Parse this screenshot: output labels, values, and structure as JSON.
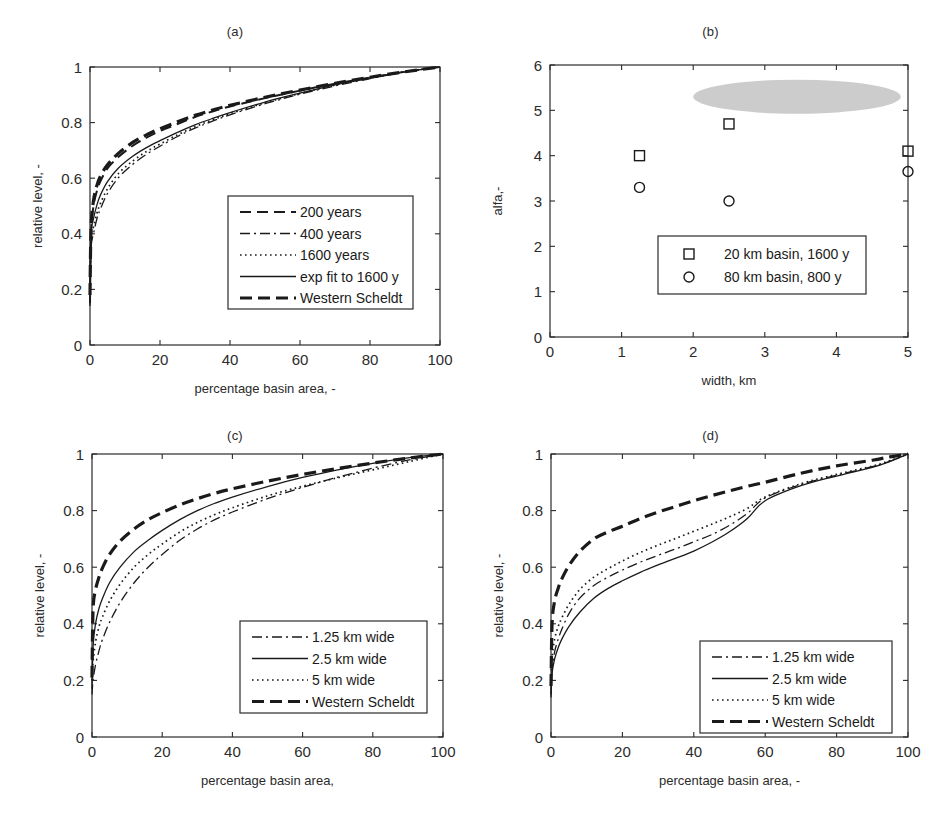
{
  "figure": {
    "background": "#ffffff",
    "axis_color": "#2b2b2b",
    "curve_color": "#1a1a1a",
    "ellipse_color": "#cccccc"
  },
  "panels": [
    {
      "id": "a",
      "title": "(a)",
      "xlabel": "percentage basin area, -",
      "ylabel": "relative level, -",
      "xticks": [
        "0",
        "20",
        "40",
        "60",
        "80",
        "100"
      ],
      "yticks": [
        "0",
        "0.2",
        "0.4",
        "0.6",
        "0.8",
        "1"
      ],
      "legend": [
        {
          "label": "200 years",
          "style": "dashed"
        },
        {
          "label": "400 years",
          "style": "dashdot"
        },
        {
          "label": "1600 years",
          "style": "dotted"
        },
        {
          "label": "exp fit to 1600 y",
          "style": "solid"
        },
        {
          "label": "Western Scheldt",
          "style": "thickdashed"
        }
      ]
    },
    {
      "id": "b",
      "title": "(b)",
      "xlabel": "width, km",
      "ylabel": "alfa,-",
      "xticks": [
        "0",
        "1",
        "2",
        "3",
        "4",
        "5"
      ],
      "yticks": [
        "0",
        "1",
        "2",
        "3",
        "4",
        "5",
        "6"
      ],
      "legend": [
        {
          "label": "20 km basin, 1600 y",
          "marker": "square"
        },
        {
          "label": "80 km basin, 800 y",
          "marker": "circle"
        }
      ]
    },
    {
      "id": "c",
      "title": "(c)",
      "xlabel": "percentage basin area,",
      "ylabel": "relative level, -",
      "xticks": [
        "0",
        "20",
        "40",
        "60",
        "80",
        "100"
      ],
      "yticks": [
        "0",
        "0.2",
        "0.4",
        "0.6",
        "0.8",
        "1"
      ],
      "legend": [
        {
          "label": "1.25 km wide",
          "style": "dashdot"
        },
        {
          "label": "2.5 km wide",
          "style": "solid"
        },
        {
          "label": "5 km wide",
          "style": "dotted"
        },
        {
          "label": "Western Scheldt",
          "style": "thickdashed"
        }
      ]
    },
    {
      "id": "d",
      "title": "(d)",
      "xlabel": "percentage basin area, -",
      "ylabel": "relative level, -",
      "xticks": [
        "0",
        "20",
        "40",
        "60",
        "80",
        "100"
      ],
      "yticks": [
        "0",
        "0.2",
        "0.4",
        "0.6",
        "0.8",
        "1"
      ],
      "legend": [
        {
          "label": "1.25 km wide",
          "style": "dashdot"
        },
        {
          "label": "2.5 km wide",
          "style": "solid"
        },
        {
          "label": "5 km wide",
          "style": "dotted"
        },
        {
          "label": "Western Scheldt",
          "style": "thickdashed"
        }
      ]
    }
  ],
  "chart_data": [
    {
      "type": "line",
      "panel": "a",
      "title": "(a)",
      "xlabel": "percentage basin area, -",
      "ylabel": "relative level, -",
      "xlim": [
        0,
        100
      ],
      "ylim": [
        0,
        1
      ],
      "xticks": [
        0,
        20,
        40,
        60,
        80,
        100
      ],
      "yticks": [
        0,
        0.2,
        0.4,
        0.6,
        0.8,
        1
      ],
      "grid": false,
      "legend_position": "lower right",
      "x": [
        0,
        0.3,
        1,
        2,
        3,
        5,
        8,
        12,
        16,
        20,
        25,
        30,
        35,
        40,
        50,
        60,
        70,
        80,
        90,
        100
      ],
      "series": [
        {
          "name": "200 years",
          "style": "dashed",
          "values": [
            0.15,
            0.4,
            0.5,
            0.555,
            0.59,
            0.635,
            0.675,
            0.715,
            0.745,
            0.77,
            0.795,
            0.82,
            0.84,
            0.858,
            0.888,
            0.915,
            0.94,
            0.962,
            0.983,
            1.0
          ]
        },
        {
          "name": "400 years",
          "style": "dashdot",
          "values": [
            0.14,
            0.345,
            0.4,
            0.455,
            0.49,
            0.545,
            0.6,
            0.648,
            0.685,
            0.715,
            0.75,
            0.78,
            0.805,
            0.828,
            0.868,
            0.902,
            0.932,
            0.958,
            0.982,
            1.0
          ]
        },
        {
          "name": "1600 years",
          "style": "dotted",
          "values": [
            0.17,
            0.38,
            0.425,
            0.475,
            0.51,
            0.562,
            0.615,
            0.66,
            0.695,
            0.723,
            0.756,
            0.785,
            0.81,
            0.832,
            0.871,
            0.905,
            0.935,
            0.96,
            0.983,
            1.0
          ]
        },
        {
          "name": "exp fit to 1600 y",
          "style": "solid",
          "values": [
            0.2,
            0.4,
            0.455,
            0.505,
            0.54,
            0.588,
            0.635,
            0.677,
            0.709,
            0.735,
            0.765,
            0.792,
            0.815,
            0.836,
            0.874,
            0.906,
            0.936,
            0.961,
            0.983,
            1.0
          ]
        },
        {
          "name": "Western Scheldt",
          "style": "thickdashed",
          "values": [
            0.18,
            0.42,
            0.52,
            0.575,
            0.608,
            0.648,
            0.688,
            0.727,
            0.755,
            0.778,
            0.803,
            0.826,
            0.845,
            0.862,
            0.891,
            0.917,
            0.941,
            0.963,
            0.983,
            1.0
          ]
        }
      ]
    },
    {
      "type": "scatter",
      "panel": "b",
      "title": "(b)",
      "xlabel": "width, km",
      "ylabel": "alfa,-",
      "xlim": [
        0,
        5
      ],
      "ylim": [
        0,
        6
      ],
      "xticks": [
        0,
        1,
        2,
        3,
        4,
        5
      ],
      "yticks": [
        0,
        1,
        2,
        3,
        4,
        5,
        6
      ],
      "grid": false,
      "legend_position": "lower right",
      "series": [
        {
          "name": "20 km basin, 1600 y",
          "marker": "square",
          "points": [
            [
              1.25,
              4.0
            ],
            [
              2.5,
              4.7
            ],
            [
              5.0,
              4.1
            ]
          ]
        },
        {
          "name": "80 km basin, 800 y",
          "marker": "circle",
          "points": [
            [
              1.25,
              3.3
            ],
            [
              2.5,
              3.0
            ],
            [
              5.0,
              3.65
            ]
          ]
        }
      ],
      "annotations": [
        {
          "type": "ellipse",
          "label": "gray shaded region",
          "center": [
            3.45,
            5.3
          ],
          "width": 2.9,
          "height": 0.75,
          "color": "#cccccc"
        }
      ]
    },
    {
      "type": "line",
      "panel": "c",
      "title": "(c)",
      "xlabel": "percentage basin area,",
      "ylabel": "relative level, -",
      "xlim": [
        0,
        100
      ],
      "ylim": [
        0,
        1
      ],
      "xticks": [
        0,
        20,
        40,
        60,
        80,
        100
      ],
      "yticks": [
        0,
        0.2,
        0.4,
        0.6,
        0.8,
        1
      ],
      "grid": false,
      "legend_position": "lower right",
      "x": [
        0,
        0.3,
        1,
        2,
        3,
        5,
        8,
        12,
        16,
        20,
        25,
        30,
        35,
        40,
        50,
        60,
        70,
        80,
        90,
        100
      ],
      "series": [
        {
          "name": "1.25 km wide",
          "style": "dashdot",
          "values": [
            0.15,
            0.2,
            0.255,
            0.305,
            0.345,
            0.405,
            0.475,
            0.545,
            0.6,
            0.645,
            0.695,
            0.735,
            0.768,
            0.795,
            0.842,
            0.882,
            0.918,
            0.95,
            0.978,
            1.0
          ]
        },
        {
          "name": "2.5 km wide",
          "style": "solid",
          "values": [
            0.17,
            0.32,
            0.4,
            0.455,
            0.49,
            0.545,
            0.6,
            0.655,
            0.695,
            0.73,
            0.768,
            0.8,
            0.826,
            0.848,
            0.885,
            0.917,
            0.944,
            0.967,
            0.986,
            1.0
          ]
        },
        {
          "name": "5 km wide",
          "style": "dotted",
          "values": [
            0.2,
            0.265,
            0.335,
            0.39,
            0.425,
            0.48,
            0.54,
            0.6,
            0.645,
            0.682,
            0.724,
            0.758,
            0.786,
            0.81,
            0.852,
            0.886,
            0.916,
            0.944,
            0.972,
            1.0
          ]
        },
        {
          "name": "Western Scheldt",
          "style": "thickdashed",
          "values": [
            0.21,
            0.45,
            0.52,
            0.565,
            0.598,
            0.645,
            0.692,
            0.735,
            0.768,
            0.793,
            0.82,
            0.842,
            0.861,
            0.877,
            0.904,
            0.928,
            0.949,
            0.968,
            0.985,
            1.0
          ]
        }
      ]
    },
    {
      "type": "line",
      "panel": "d",
      "title": "(d)",
      "xlabel": "percentage basin area, -",
      "ylabel": "relative level, -",
      "xlim": [
        0,
        100
      ],
      "ylim": [
        0,
        1
      ],
      "xticks": [
        0,
        20,
        40,
        60,
        80,
        100
      ],
      "yticks": [
        0,
        0.2,
        0.4,
        0.6,
        0.8,
        1
      ],
      "grid": false,
      "legend_position": "lower right",
      "x": [
        0,
        0.3,
        1,
        2,
        3,
        5,
        8,
        12,
        16,
        20,
        25,
        30,
        35,
        40,
        45,
        50,
        55,
        60,
        70,
        80,
        90,
        95,
        100
      ],
      "series": [
        {
          "name": "1.25 km wide",
          "style": "dashdot",
          "values": [
            0.15,
            0.235,
            0.3,
            0.345,
            0.38,
            0.435,
            0.49,
            0.535,
            0.565,
            0.59,
            0.618,
            0.642,
            0.665,
            0.69,
            0.715,
            0.748,
            0.79,
            0.845,
            0.892,
            0.925,
            0.955,
            0.975,
            1.0
          ]
        },
        {
          "name": "2.5 km wide",
          "style": "solid",
          "values": [
            0.14,
            0.225,
            0.275,
            0.315,
            0.345,
            0.39,
            0.44,
            0.49,
            0.525,
            0.552,
            0.582,
            0.608,
            0.632,
            0.657,
            0.688,
            0.725,
            0.772,
            0.835,
            0.888,
            0.922,
            0.953,
            0.974,
            1.0
          ]
        },
        {
          "name": "5 km wide",
          "style": "dotted",
          "values": [
            0.2,
            0.28,
            0.345,
            0.39,
            0.42,
            0.468,
            0.52,
            0.565,
            0.595,
            0.622,
            0.652,
            0.678,
            0.702,
            0.727,
            0.752,
            0.778,
            0.808,
            0.848,
            0.895,
            0.928,
            0.957,
            0.977,
            1.0
          ]
        },
        {
          "name": "Western Scheldt",
          "style": "thickdashed",
          "values": [
            0.18,
            0.4,
            0.48,
            0.525,
            0.558,
            0.605,
            0.655,
            0.7,
            0.725,
            0.745,
            0.772,
            0.795,
            0.815,
            0.835,
            0.853,
            0.87,
            0.886,
            0.9,
            0.932,
            0.958,
            0.978,
            0.99,
            1.0
          ]
        }
      ]
    }
  ]
}
